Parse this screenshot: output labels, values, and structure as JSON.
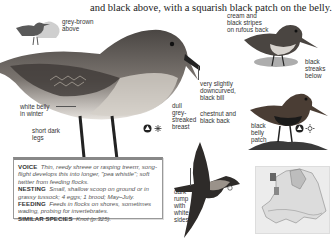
{
  "page": {
    "intro_text": "and black above, with a squarish black patch on the belly."
  },
  "main_illustration": {
    "labels": {
      "grey_brown_above": [
        "grey-brown",
        "above"
      ],
      "white_belly": [
        "white belly",
        "in winter"
      ],
      "short_legs": [
        "short dark",
        "legs"
      ],
      "breast": [
        "dull",
        "grey-",
        "streaked",
        "breast"
      ],
      "bill": [
        "very slightly",
        "downcurved,",
        "black bill"
      ]
    },
    "season_icons": [
      "winter-plumage-icon",
      "snowflake-icon"
    ]
  },
  "juvenile_illustration": {
    "labels": {
      "back": [
        "cream and",
        "black stripes",
        "on rufous back"
      ],
      "below": [
        "black",
        "streaks",
        "below"
      ]
    }
  },
  "breeding_illustration": {
    "labels": {
      "back": [
        "chestnut and",
        "black back"
      ],
      "belly": [
        "black",
        "belly",
        "patch"
      ]
    },
    "season_icons": [
      "breeding-plumage-icon",
      "sun-icon"
    ]
  },
  "flight_illustration": {
    "labels": {
      "rump": [
        "dark",
        "rump",
        "with",
        "white",
        "sides"
      ]
    }
  },
  "info_box": {
    "voice_label": "VOICE",
    "voice_text": "Thin, reedy shreee or rasping treerrr, song-flight develops this into longer, \"pea whistle\"; soft twitter from feeding flocks.",
    "nesting_label": "NESTING",
    "nesting_text": "Small, shallow scoop on ground or in grassy tussock; 4 eggs; 1 brood; May–July.",
    "feeding_label": "FEEDING",
    "feeding_text": "Feeds in flocks on shores, sometimes wading, probing for invertebrates.",
    "similar_label": "SIMILAR SPECIES",
    "similar_text": "Knot (p.325)."
  },
  "map": {
    "region": "Europe distribution map"
  },
  "colors": {
    "bird_dark": "#3a3a3a",
    "bird_mid": "#8a8580",
    "bird_light": "#d8d4cf",
    "silhouette_dark": "#5a5a5a",
    "silhouette_light": "#cfcfcf",
    "box_border": "#999999",
    "map_bg": "#ececec"
  }
}
